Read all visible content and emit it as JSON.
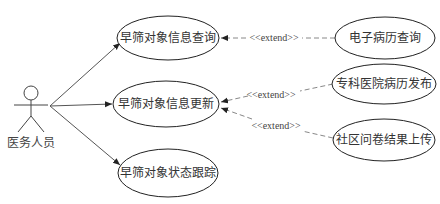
{
  "diagram": {
    "type": "use-case",
    "actor": {
      "label": "医务人员"
    },
    "use_cases": [
      {
        "id": "uc1",
        "label": "早筛对象信息查询"
      },
      {
        "id": "uc2",
        "label": "早筛对象信息更新"
      },
      {
        "id": "uc3",
        "label": "早筛对象状态跟踪"
      }
    ],
    "extensions": [
      {
        "id": "ex1",
        "label": "电子病历查询",
        "extends": "uc1",
        "stereotype": "<<extend>>"
      },
      {
        "id": "ex2",
        "label": "专科医院病历发布",
        "extends": "uc2",
        "stereotype": "<<extend>>"
      },
      {
        "id": "ex3",
        "label": "社区问卷结果上传",
        "extends": "uc2",
        "stereotype": "<<extend>>"
      }
    ],
    "colors": {
      "line": "#555555",
      "dashed": "#888888",
      "text": "#333333"
    }
  }
}
